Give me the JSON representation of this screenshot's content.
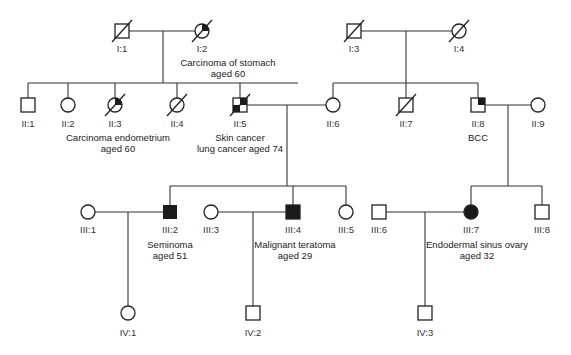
{
  "diagram": {
    "type": "pedigree",
    "colors": {
      "line": "#333333",
      "affected": "#1a1a1a",
      "background": "#ffffff"
    },
    "individuals": {
      "I1": {
        "id": "I:1",
        "sex": "male",
        "deceased": true,
        "affected": "none"
      },
      "I2": {
        "id": "I:2",
        "sex": "female",
        "deceased": true,
        "affected": "partial-quadrant",
        "note_line1": "Carcinoma of stomach",
        "note_line2": "aged 60"
      },
      "I3": {
        "id": "I:3",
        "sex": "male",
        "deceased": true,
        "affected": "none"
      },
      "I4": {
        "id": "I:4",
        "sex": "female",
        "deceased": true,
        "affected": "none"
      },
      "II1": {
        "id": "II:1",
        "sex": "male",
        "deceased": false,
        "affected": "none"
      },
      "II2": {
        "id": "II:2",
        "sex": "female",
        "deceased": false,
        "affected": "none"
      },
      "II3": {
        "id": "II:3",
        "sex": "female",
        "deceased": true,
        "affected": "partial-quadrant",
        "note_line1": "Carcinoma endometrium",
        "note_line2": "aged 60"
      },
      "II4": {
        "id": "II:4",
        "sex": "female",
        "deceased": true,
        "affected": "none"
      },
      "II5": {
        "id": "II:5",
        "sex": "male",
        "deceased": true,
        "affected": "two-quadrants",
        "note_line1": "Skin cancer",
        "note_line2": "lung cancer aged 74"
      },
      "II6": {
        "id": "II:6",
        "sex": "female",
        "deceased": false,
        "affected": "none"
      },
      "II7": {
        "id": "II:7",
        "sex": "male",
        "deceased": true,
        "affected": "none"
      },
      "II8": {
        "id": "II:8",
        "sex": "male",
        "deceased": false,
        "affected": "one-quadrant",
        "note_line1": "BCC"
      },
      "II9": {
        "id": "II:9",
        "sex": "female",
        "deceased": false,
        "affected": "none"
      },
      "III1": {
        "id": "III:1",
        "sex": "female",
        "deceased": false,
        "affected": "none"
      },
      "III2": {
        "id": "III:2",
        "sex": "male",
        "deceased": false,
        "affected": "full",
        "note_line1": "Seminoma",
        "note_line2": "aged 51"
      },
      "III3": {
        "id": "III:3",
        "sex": "female",
        "deceased": false,
        "affected": "none"
      },
      "III4": {
        "id": "III:4",
        "sex": "male",
        "deceased": false,
        "affected": "full",
        "note_line1": "Malignant teratoma",
        "note_line2": "aged 29"
      },
      "III5": {
        "id": "III:5",
        "sex": "female",
        "deceased": false,
        "affected": "none"
      },
      "III6": {
        "id": "III:6",
        "sex": "male",
        "deceased": false,
        "affected": "none"
      },
      "III7": {
        "id": "III:7",
        "sex": "female",
        "deceased": false,
        "affected": "full",
        "note_line1": "Endodermal sinus ovary",
        "note_line2": "aged 32"
      },
      "III8": {
        "id": "III:8",
        "sex": "male",
        "deceased": false,
        "affected": "none"
      },
      "IV1": {
        "id": "IV:1",
        "sex": "female",
        "deceased": false,
        "affected": "none"
      },
      "IV2": {
        "id": "IV:2",
        "sex": "male",
        "deceased": false,
        "affected": "none"
      },
      "IV3": {
        "id": "IV:3",
        "sex": "male",
        "deceased": false,
        "affected": "none"
      }
    }
  }
}
